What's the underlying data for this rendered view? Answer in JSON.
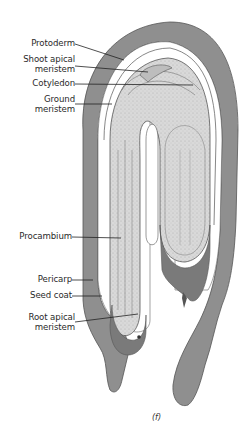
{
  "figure": {
    "panel_label": "(f)",
    "colors": {
      "pericarp": "#8c8c8c",
      "embryo_fill": "#d6d6d6",
      "outline": "#555555",
      "leader_line": "#222222",
      "background": "#ffffff"
    },
    "labels": [
      {
        "id": "protoderm",
        "text_lines": [
          "Protoderm"
        ]
      },
      {
        "id": "shoot-apical-meristem",
        "text_lines": [
          "Shoot apical",
          "meristem"
        ]
      },
      {
        "id": "cotyledon",
        "text_lines": [
          "Cotyledon"
        ]
      },
      {
        "id": "ground-meristem",
        "text_lines": [
          "Ground",
          "meristem"
        ]
      },
      {
        "id": "procambium",
        "text_lines": [
          "Procambium"
        ]
      },
      {
        "id": "pericarp",
        "text_lines": [
          "Pericarp"
        ]
      },
      {
        "id": "seed-coat",
        "text_lines": [
          "Seed coat"
        ]
      },
      {
        "id": "root-apical-meristem",
        "text_lines": [
          "Root apical",
          "meristem"
        ]
      }
    ]
  }
}
